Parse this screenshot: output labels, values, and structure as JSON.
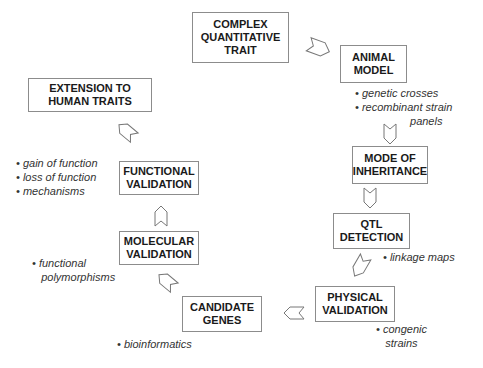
{
  "diagram": {
    "type": "cyclic-flow",
    "nodes": [
      {
        "id": "complex_trait",
        "label": "COMPLEX\nQUANTITATIVE\nTRAIT"
      },
      {
        "id": "animal_model",
        "label": "ANIMAL\nMODEL"
      },
      {
        "id": "mode_of_inheritance",
        "label": "MODE OF\nINHERITANCE"
      },
      {
        "id": "qtl_detection",
        "label": "QTL\nDETECTION"
      },
      {
        "id": "physical_validation",
        "label": "PHYSICAL\nVALIDATION"
      },
      {
        "id": "candidate_genes",
        "label": "CANDIDATE\nGENES"
      },
      {
        "id": "molecular_validation",
        "label": "MOLECULAR\nVALIDATION"
      },
      {
        "id": "functional_validation",
        "label": "FUNCTIONAL\nVALIDATION"
      },
      {
        "id": "extension_human",
        "label": "EXTENSION TO\nHUMAN TRAITS"
      }
    ],
    "notes": {
      "animal_model": "• genetic crosses\n• recombinant strain\n                  panels",
      "qtl_detection": "• linkage maps",
      "physical_validation": "• congenic\n   strains",
      "candidate_genes": "• bioinformatics",
      "molecular_validation": "• functional\n   polymorphisms",
      "functional_validation": "• gain of function\n• loss of function\n• mechanisms"
    },
    "edges": [
      [
        "complex_trait",
        "animal_model"
      ],
      [
        "animal_model",
        "mode_of_inheritance"
      ],
      [
        "mode_of_inheritance",
        "qtl_detection"
      ],
      [
        "qtl_detection",
        "physical_validation"
      ],
      [
        "physical_validation",
        "candidate_genes"
      ],
      [
        "candidate_genes",
        "molecular_validation"
      ],
      [
        "molecular_validation",
        "functional_validation"
      ],
      [
        "functional_validation",
        "extension_human"
      ]
    ]
  }
}
